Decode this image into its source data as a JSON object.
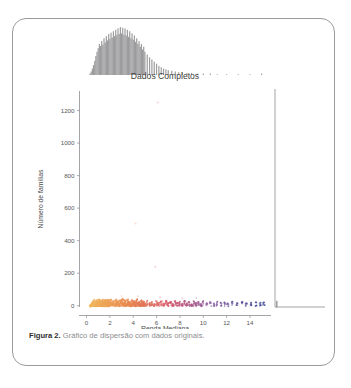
{
  "figure": {
    "caption_label": "Figura 2.",
    "caption_text": "Gráfico de dispersão com dados originais."
  },
  "chart_data": {
    "type": "scatter",
    "title": "Dados Completos",
    "xlabel": "Renda Mediana",
    "ylabel": "Número de famílias",
    "xlim": [
      -0.6,
      15.8
    ],
    "ylim": [
      -60,
      1320
    ],
    "xticks": [
      0,
      2,
      4,
      6,
      8,
      10,
      12,
      14
    ],
    "xtick_labels": [
      "0",
      "2",
      "4",
      "6",
      "8",
      "10",
      "12",
      "14"
    ],
    "yticks": [
      0,
      200,
      400,
      600,
      800,
      1000,
      1200
    ],
    "ytick_labels": [
      "0",
      "200",
      "400",
      "600",
      "800",
      "1000",
      "1200"
    ],
    "grid": false,
    "legend": false,
    "colormap": "coolwarm-by-x",
    "colors": {
      "low": "#f2b95e",
      "mid_low": "#e98b52",
      "mid": "#d8596a",
      "mid_high": "#8a5a9e",
      "high": "#2e3d8f",
      "marginal_hist": "#8a8a8c",
      "axis": "#8e8e90",
      "text": "#4a4a4c"
    },
    "marginal_top": {
      "type": "histogram",
      "orientation": "x",
      "color": "#8a8a8c",
      "bin_width": 0.1,
      "bins_x": [
        0.3,
        0.4,
        0.5,
        0.6,
        0.7,
        0.8,
        0.9,
        1.0,
        1.1,
        1.2,
        1.3,
        1.4,
        1.5,
        1.6,
        1.7,
        1.8,
        1.9,
        2.0,
        2.1,
        2.2,
        2.3,
        2.4,
        2.5,
        2.6,
        2.7,
        2.8,
        2.9,
        3.0,
        3.1,
        3.2,
        3.3,
        3.4,
        3.5,
        3.6,
        3.7,
        3.8,
        3.9,
        4.0,
        4.1,
        4.2,
        4.3,
        4.4,
        4.5,
        4.6,
        4.7,
        4.8,
        4.9,
        5.0,
        5.2,
        5.4,
        5.6,
        5.8,
        6.0,
        6.2,
        6.4,
        6.6,
        6.8,
        7.0,
        7.3,
        7.6,
        7.9,
        8.2,
        8.6,
        9.0,
        9.5,
        10.0,
        10.6,
        11.2,
        12.0,
        13.0,
        14.0,
        15.0
      ],
      "bins_count": [
        2,
        5,
        9,
        14,
        20,
        27,
        33,
        38,
        44,
        41,
        48,
        43,
        52,
        46,
        55,
        49,
        58,
        51,
        60,
        53,
        62,
        55,
        64,
        57,
        66,
        58,
        68,
        59,
        67,
        57,
        66,
        56,
        64,
        54,
        62,
        52,
        59,
        50,
        56,
        47,
        52,
        44,
        48,
        40,
        44,
        36,
        40,
        33,
        29,
        25,
        22,
        19,
        16,
        13,
        11,
        9,
        8,
        7,
        6,
        5,
        4,
        4,
        3,
        3,
        2,
        2,
        2,
        1,
        1,
        1,
        1,
        2
      ]
    },
    "marginal_right": {
      "type": "histogram",
      "orientation": "y",
      "color": "#8a8a8c",
      "note": "near-zero counts except a tall narrow spike at y near 0"
    },
    "points_note": "Dense horizontal band of points near y = 0 across x from about 0.3 to 15.2, colored by x from warm yellow-orange at low x through red/pink at mid x to dark blue at high x, with sparse faint outliers up to y near 1250.",
    "points": [
      {
        "x": 0.35,
        "y": 6
      },
      {
        "x": 0.45,
        "y": 12
      },
      {
        "x": 0.5,
        "y": 20
      },
      {
        "x": 0.55,
        "y": 9
      },
      {
        "x": 0.6,
        "y": 28
      },
      {
        "x": 0.65,
        "y": 15
      },
      {
        "x": 0.7,
        "y": 33
      },
      {
        "x": 0.75,
        "y": 8
      },
      {
        "x": 0.8,
        "y": 24
      },
      {
        "x": 0.85,
        "y": 17
      },
      {
        "x": 0.9,
        "y": 31
      },
      {
        "x": 0.95,
        "y": 11
      },
      {
        "x": 1.0,
        "y": 26
      },
      {
        "x": 1.05,
        "y": 14
      },
      {
        "x": 1.1,
        "y": 35
      },
      {
        "x": 1.15,
        "y": 19
      },
      {
        "x": 1.2,
        "y": 22
      },
      {
        "x": 1.25,
        "y": 10
      },
      {
        "x": 1.3,
        "y": 29
      },
      {
        "x": 1.35,
        "y": 16
      },
      {
        "x": 1.4,
        "y": 37
      },
      {
        "x": 1.45,
        "y": 13
      },
      {
        "x": 1.5,
        "y": 25
      },
      {
        "x": 1.55,
        "y": 18
      },
      {
        "x": 1.6,
        "y": 32
      },
      {
        "x": 1.65,
        "y": 9
      },
      {
        "x": 1.7,
        "y": 27
      },
      {
        "x": 1.75,
        "y": 21
      },
      {
        "x": 1.8,
        "y": 34
      },
      {
        "x": 1.85,
        "y": 12
      },
      {
        "x": 1.9,
        "y": 23
      },
      {
        "x": 1.95,
        "y": 30
      },
      {
        "x": 2.0,
        "y": 15
      },
      {
        "x": 2.1,
        "y": 36
      },
      {
        "x": 2.2,
        "y": 20
      },
      {
        "x": 2.3,
        "y": 28
      },
      {
        "x": 2.4,
        "y": 11
      },
      {
        "x": 2.5,
        "y": 33
      },
      {
        "x": 2.6,
        "y": 18
      },
      {
        "x": 2.7,
        "y": 26
      },
      {
        "x": 2.8,
        "y": 14
      },
      {
        "x": 2.9,
        "y": 31
      },
      {
        "x": 3.0,
        "y": 22
      },
      {
        "x": 3.1,
        "y": 38
      },
      {
        "x": 3.2,
        "y": 16
      },
      {
        "x": 3.3,
        "y": 29
      },
      {
        "x": 3.4,
        "y": 13
      },
      {
        "x": 3.5,
        "y": 34
      },
      {
        "x": 3.6,
        "y": 19
      },
      {
        "x": 3.7,
        "y": 25
      },
      {
        "x": 3.8,
        "y": 10
      },
      {
        "x": 3.9,
        "y": 32
      },
      {
        "x": 4.0,
        "y": 21
      },
      {
        "x": 4.1,
        "y": 27
      },
      {
        "x": 4.2,
        "y": 15
      },
      {
        "x": 4.3,
        "y": 35
      },
      {
        "x": 4.4,
        "y": 18
      },
      {
        "x": 4.5,
        "y": 24
      },
      {
        "x": 4.6,
        "y": 12
      },
      {
        "x": 4.7,
        "y": 30
      },
      {
        "x": 4.8,
        "y": 20
      },
      {
        "x": 4.9,
        "y": 26
      },
      {
        "x": 5.0,
        "y": 14
      },
      {
        "x": 5.2,
        "y": 31
      },
      {
        "x": 5.4,
        "y": 17
      },
      {
        "x": 5.6,
        "y": 23
      },
      {
        "x": 5.8,
        "y": 11
      },
      {
        "x": 6.0,
        "y": 28
      },
      {
        "x": 6.2,
        "y": 19
      },
      {
        "x": 6.4,
        "y": 25
      },
      {
        "x": 6.6,
        "y": 13
      },
      {
        "x": 6.8,
        "y": 30
      },
      {
        "x": 7.0,
        "y": 16
      },
      {
        "x": 7.2,
        "y": 22
      },
      {
        "x": 7.4,
        "y": 10
      },
      {
        "x": 7.6,
        "y": 27
      },
      {
        "x": 7.8,
        "y": 18
      },
      {
        "x": 8.0,
        "y": 24
      },
      {
        "x": 8.2,
        "y": 12
      },
      {
        "x": 8.4,
        "y": 29
      },
      {
        "x": 8.6,
        "y": 15
      },
      {
        "x": 8.8,
        "y": 21
      },
      {
        "x": 9.0,
        "y": 9
      },
      {
        "x": 9.2,
        "y": 26
      },
      {
        "x": 9.4,
        "y": 17
      },
      {
        "x": 9.6,
        "y": 23
      },
      {
        "x": 9.8,
        "y": 11
      },
      {
        "x": 10.0,
        "y": 28
      },
      {
        "x": 10.3,
        "y": 16
      },
      {
        "x": 10.6,
        "y": 22
      },
      {
        "x": 10.9,
        "y": 13
      },
      {
        "x": 11.2,
        "y": 25
      },
      {
        "x": 11.5,
        "y": 18
      },
      {
        "x": 11.8,
        "y": 20
      },
      {
        "x": 12.1,
        "y": 14
      },
      {
        "x": 12.5,
        "y": 24
      },
      {
        "x": 12.9,
        "y": 17
      },
      {
        "x": 13.3,
        "y": 21
      },
      {
        "x": 13.7,
        "y": 15
      },
      {
        "x": 14.1,
        "y": 19
      },
      {
        "x": 14.5,
        "y": 22
      },
      {
        "x": 14.9,
        "y": 18
      },
      {
        "x": 15.2,
        "y": 20
      }
    ],
    "outliers": [
      {
        "x": 6.1,
        "y": 1250
      },
      {
        "x": 4.2,
        "y": 505
      },
      {
        "x": 5.9,
        "y": 240
      },
      {
        "x": 3.0,
        "y": 60
      },
      {
        "x": 4.4,
        "y": 58
      },
      {
        "x": 6.3,
        "y": 52
      },
      {
        "x": 9.4,
        "y": 48
      },
      {
        "x": 8.2,
        "y": 45
      },
      {
        "x": 2.1,
        "y": 42
      }
    ]
  }
}
